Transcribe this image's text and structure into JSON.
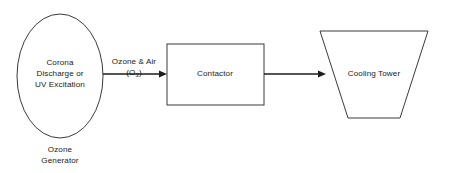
{
  "diagram": {
    "background_color": "#ffffff",
    "outline_color": "#3a3a3a",
    "connector_color": "#1d1d1d",
    "nodes": {
      "ozone_generator": {
        "shape": "ellipse",
        "inner_line_1": "Corona",
        "inner_line_2": "Discharge or",
        "inner_line_3": "UV Excitation",
        "caption_line_1": "Ozone",
        "caption_line_2": "Generator"
      },
      "contactor": {
        "shape": "rectangle",
        "label": "Contactor"
      },
      "cooling_tower": {
        "shape": "trapezoid",
        "label": "Cooling Tower"
      }
    },
    "connectors": {
      "generator_to_contactor": {
        "label_line_1": "Ozone & Air",
        "label_line_2_prefix": "(O",
        "label_line_2_subscript": "3",
        "label_line_2_suffix": ")",
        "direction": "right"
      },
      "contactor_to_cooling_tower": {
        "label": "",
        "direction": "right"
      }
    }
  }
}
